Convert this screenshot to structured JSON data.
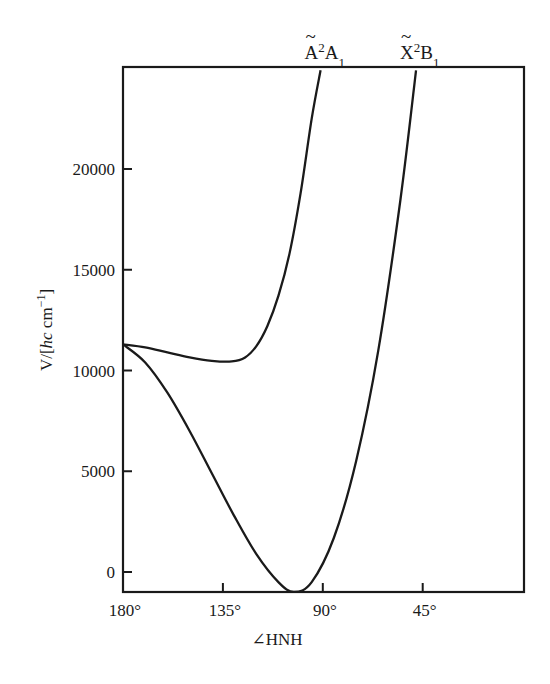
{
  "chart_data": {
    "type": "line",
    "title": "",
    "xlabel": "∠HNH",
    "ylabel": "V/[hc cm⁻¹]",
    "ylabel_parts": {
      "pre": "V/[",
      "italic": "hc",
      "post": " cm",
      "sup": "−1",
      "close": "]"
    },
    "xlim": [
      180,
      0
    ],
    "ylim": [
      -1000,
      24900
    ],
    "x_reversed": true,
    "grid": false,
    "legend": "none (curves labeled at top)",
    "x_ticks": [
      {
        "value": 180,
        "label": "180°"
      },
      {
        "value": 135,
        "label": "135°"
      },
      {
        "value": 90,
        "label": "90°"
      },
      {
        "value": 45,
        "label": "45°"
      }
    ],
    "y_ticks": [
      {
        "value": 0,
        "label": "0"
      },
      {
        "value": 5000,
        "label": "5000"
      },
      {
        "value": 10000,
        "label": "10000"
      },
      {
        "value": 15000,
        "label": "15000"
      },
      {
        "value": 20000,
        "label": "20000"
      }
    ],
    "series": [
      {
        "name": "Ã²A₁",
        "label_main": "A",
        "label_sup": "2",
        "label_sym": "A",
        "label_sub": "1",
        "x": [
          180,
          170,
          160,
          150,
          140,
          131,
          125,
          120,
          115,
          110,
          105,
          100,
          95,
          91
        ],
        "values": [
          11300,
          11150,
          10900,
          10650,
          10480,
          10450,
          10650,
          11200,
          12200,
          13700,
          15800,
          18800,
          22500,
          24900
        ]
      },
      {
        "name": "X̃²B₁",
        "label_main": "X",
        "label_sup": "2",
        "label_sym": "B",
        "label_sub": "1",
        "x": [
          180,
          170,
          160,
          150,
          140,
          130,
          120,
          110,
          103,
          95,
          85,
          75,
          65,
          55,
          48
        ],
        "values": [
          11300,
          10400,
          8900,
          7000,
          4900,
          2800,
          900,
          -500,
          -1000,
          -500,
          1700,
          5500,
          11000,
          18500,
          24900
        ]
      }
    ]
  }
}
